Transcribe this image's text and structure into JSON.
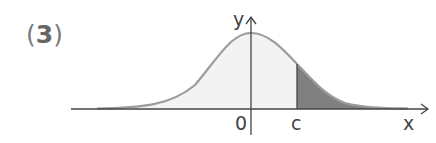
{
  "problem": {
    "open_paren": "(",
    "number": "3",
    "close_paren": ")"
  },
  "diagram": {
    "type": "normal-distribution-curve",
    "axis_labels": {
      "x": "x",
      "y": "y"
    },
    "tick_labels": {
      "origin": "0",
      "c": "c"
    },
    "shaded_region": "x > c (right tail)",
    "colors": {
      "curve": "#9a9a9a",
      "light_fill": "#f2f2f2",
      "dark_fill": "#7f7f7f",
      "axis": "#444444"
    }
  }
}
